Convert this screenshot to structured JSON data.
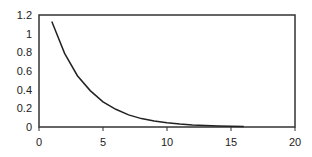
{
  "chart_data": {
    "type": "line",
    "title": "",
    "xlabel": "",
    "ylabel": "",
    "xlim": [
      0,
      20
    ],
    "ylim": [
      0,
      1.2
    ],
    "x_ticks": [
      "0",
      "5",
      "10",
      "15",
      "20"
    ],
    "y_ticks": [
      "0",
      "0.2",
      "0.4",
      "0.6",
      "0.8",
      "1",
      "1.2"
    ],
    "grid": false,
    "legend": null,
    "series": [
      {
        "name": "series1",
        "color": "#222222",
        "x": [
          1,
          2,
          3,
          4,
          5,
          6,
          7,
          8,
          9,
          10,
          11,
          12,
          13,
          14,
          15,
          16
        ],
        "values": [
          1.13,
          0.79,
          0.55,
          0.39,
          0.27,
          0.19,
          0.13,
          0.09,
          0.065,
          0.045,
          0.032,
          0.022,
          0.016,
          0.011,
          0.008,
          0.005
        ]
      }
    ]
  }
}
